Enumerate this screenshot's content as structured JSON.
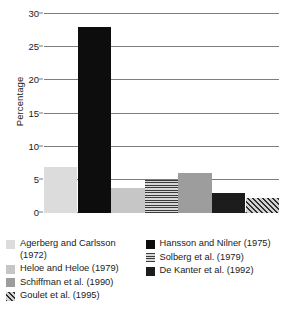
{
  "chart_data": {
    "type": "bar",
    "title": "",
    "subtitle": "",
    "xlabel": "",
    "ylabel": "Percentage",
    "ylim": [
      0,
      30
    ],
    "yticks": [
      0,
      5,
      10,
      15,
      20,
      25,
      30
    ],
    "ytick_labels": [
      "0",
      "5",
      "10",
      "15",
      "20",
      "25",
      "30"
    ],
    "grid": true,
    "legend_position": "below",
    "categories": [
      "Agerberg and Carlsson (1972)",
      "Hansson and Nilner (1975)",
      "Heloe and Heloe (1979)",
      "Solberg et al. (1979)",
      "Schiffman et al. (1990)",
      "De Kanter et al. (1992)",
      "Goulet et al. (1995)"
    ],
    "values": [
      7.0,
      28.0,
      3.8,
      5.0,
      6.0,
      3.0,
      2.2
    ],
    "bars": [
      {
        "label": "Agerberg and Carlsson (1972)",
        "value": 7.0,
        "fill": "fill-light",
        "color": "#dcdcdc",
        "pattern": "solid"
      },
      {
        "label": "Hansson and Nilner (1975)",
        "value": 28.0,
        "fill": "fill-black",
        "color": "#0d0d0d",
        "pattern": "solid"
      },
      {
        "label": "Heloe and Heloe (1979)",
        "value": 3.8,
        "fill": "fill-lightmed",
        "color": "#c6c6c6",
        "pattern": "solid"
      },
      {
        "label": "Solberg et al. (1979)",
        "value": 5.0,
        "fill": "fill-hstripe",
        "color": "#cfcfcf",
        "pattern": "horizontal-lines"
      },
      {
        "label": "Schiffman et al. (1990)",
        "value": 6.0,
        "fill": "fill-med",
        "color": "#9d9d9d",
        "pattern": "solid"
      },
      {
        "label": "De Kanter et al. (1992)",
        "value": 3.0,
        "fill": "fill-dark",
        "color": "#1c1c1c",
        "pattern": "solid"
      },
      {
        "label": "Goulet et al. (1995)",
        "value": 2.2,
        "fill": "fill-diag",
        "color": "#bdbdbd",
        "pattern": "diagonal-hatch"
      }
    ]
  },
  "legend": {
    "left_column": [
      {
        "label": "Agerberg and Carlsson (1972)",
        "fill": "fill-light",
        "swatch_name": "legend-swatch-agerberg"
      },
      {
        "label": "Heloe and Heloe (1979)",
        "fill": "fill-lightmed",
        "swatch_name": "legend-swatch-heloe"
      },
      {
        "label": "Schiffman et al. (1990)",
        "fill": "fill-med",
        "swatch_name": "legend-swatch-schiffman"
      },
      {
        "label": "Goulet et al. (1995)",
        "fill": "fill-diag",
        "swatch_name": "legend-swatch-goulet"
      }
    ],
    "right_column": [
      {
        "label": "Hansson and Nilner (1975)",
        "fill": "fill-black",
        "swatch_name": "legend-swatch-hansson"
      },
      {
        "label": "Solberg et al. (1979)",
        "fill": "fill-hstripe",
        "swatch_name": "legend-swatch-solberg"
      },
      {
        "label": "De Kanter et al. (1992)",
        "fill": "fill-dark",
        "swatch_name": "legend-swatch-dekanter"
      }
    ]
  }
}
